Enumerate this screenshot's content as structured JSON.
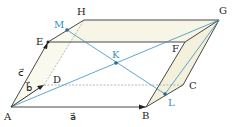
{
  "diagram": {
    "vertices": {
      "A": "A",
      "B": "B",
      "C": "C",
      "D": "D",
      "E": "E",
      "F": "F",
      "G": "G",
      "H": "H"
    },
    "points": {
      "M": "M",
      "K": "K",
      "L": "L"
    },
    "vectors": {
      "a": "a⃗",
      "b": "b⃗",
      "c": "c⃗"
    },
    "colors": {
      "edge": "#333333",
      "blue": "#3a8fc0",
      "face": "#f7f5e6"
    }
  }
}
